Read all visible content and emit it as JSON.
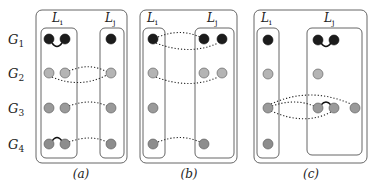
{
  "rows": {
    "g1": {
      "main": "G",
      "sub": "1"
    },
    "g2": {
      "main": "G",
      "sub": "2"
    },
    "g3": {
      "main": "G",
      "sub": "3"
    },
    "g4": {
      "main": "G",
      "sub": "4"
    }
  },
  "panels": {
    "a": {
      "caption": "(a)",
      "left_label": {
        "main": "L",
        "sub": "i"
      },
      "right_label": {
        "main": "L",
        "sub": "j"
      }
    },
    "b": {
      "caption": "(b)",
      "left_label": {
        "main": "L",
        "sub": "i"
      },
      "right_label": {
        "main": "L",
        "sub": "j"
      }
    },
    "c": {
      "caption": "(c)",
      "left_label": {
        "main": "L",
        "sub": "i"
      },
      "right_label": {
        "main": "L",
        "sub": "j"
      }
    }
  },
  "colors": {
    "G1": "#1c1c1c",
    "G2": "#b4b4b4",
    "G3": "#9a9a9a",
    "G4": "#8d8d8d"
  }
}
